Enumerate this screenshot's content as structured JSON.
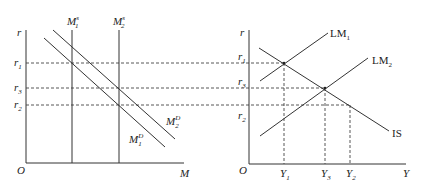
{
  "diagram": {
    "left_panel": {
      "y_axis_label": "r",
      "x_axis_label": "M",
      "origin_label": "O",
      "y_ticks": [
        {
          "label": "r",
          "sub": "1"
        },
        {
          "label": "r",
          "sub": "3"
        },
        {
          "label": "r",
          "sub": "2"
        }
      ],
      "curves": [
        {
          "label": "M",
          "sub": "1",
          "sup": "s",
          "type": "vertical money supply"
        },
        {
          "label": "M",
          "sub": "2",
          "sup": "s",
          "type": "vertical money supply"
        },
        {
          "label": "M",
          "sub": "1",
          "sup": "D",
          "type": "downward money demand"
        },
        {
          "label": "M",
          "sub": "2",
          "sup": "D",
          "type": "downward money demand"
        }
      ]
    },
    "right_panel": {
      "y_axis_label": "r",
      "x_axis_label": "Y",
      "origin_label": "O",
      "y_ticks": [
        {
          "label": "r",
          "sub": "1"
        },
        {
          "label": "r",
          "sub": "3"
        },
        {
          "label": "r",
          "sub": "2"
        }
      ],
      "x_ticks": [
        {
          "label": "Y",
          "sub": "1"
        },
        {
          "label": "Y",
          "sub": "3"
        },
        {
          "label": "Y",
          "sub": "2"
        }
      ],
      "curves": [
        {
          "label": "LM",
          "sub": "1",
          "type": "upward"
        },
        {
          "label": "LM",
          "sub": "2",
          "type": "upward"
        },
        {
          "label": "IS",
          "sub": "",
          "type": "downward"
        }
      ]
    }
  }
}
